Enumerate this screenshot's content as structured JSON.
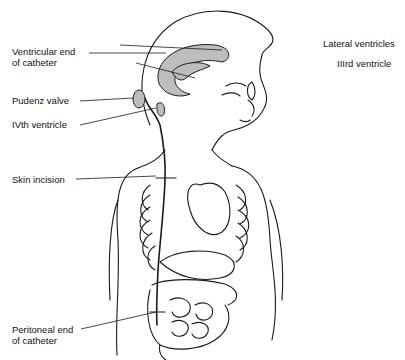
{
  "diagram": {
    "labels": {
      "ventricular_end_1": "Ventricular end",
      "ventricular_end_2": "of catheter",
      "lateral_ventricles": "Lateral ventricles",
      "third_ventricle": "IIIrd ventricle",
      "pudenz_valve": "Pudenz valve",
      "fourth_ventricle": "IVth ventricle",
      "skin_incision": "Skin incision",
      "peritoneal_end_1": "Peritoneal end",
      "peritoneal_end_2": "of catheter"
    },
    "colors": {
      "line": "#1a1a1a",
      "ventricle_fill": "#bdbdbd",
      "background": "#ffffff"
    }
  }
}
